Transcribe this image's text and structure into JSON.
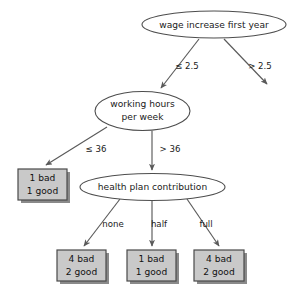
{
  "figure": {
    "background_color": "#ffffff",
    "node_fill": "#ffffff",
    "node_stroke": "#4d4d4d",
    "leaf_fill": "#c9c9c9",
    "leaf_stroke": "#4a4a4a",
    "edge_color": "#5a5a5a",
    "text_color": "#1a1a1a"
  },
  "nodes": {
    "root": {
      "label": "wage increase first year",
      "shape": "ellipse"
    },
    "working_hours": {
      "label_line1": "working hours",
      "label_line2": "per week",
      "shape": "ellipse"
    },
    "health_plan": {
      "label": "health plan contribution",
      "shape": "ellipse"
    }
  },
  "leaves": {
    "hours_le_36": {
      "line1": "1 bad",
      "line2": "1 good"
    },
    "none": {
      "line1": "4 bad",
      "line2": "2 good"
    },
    "half": {
      "line1": "1 bad",
      "line2": "1 good"
    },
    "full": {
      "line1": "4 bad",
      "line2": "2 good"
    }
  },
  "edge_labels": {
    "root_left": "≤ 2.5",
    "root_right": "> 2.5",
    "hours_left": "≤ 36",
    "hours_right": "> 36",
    "plan_none": "none",
    "plan_half": "half",
    "plan_full": "full"
  },
  "caption": {
    "text": ""
  }
}
